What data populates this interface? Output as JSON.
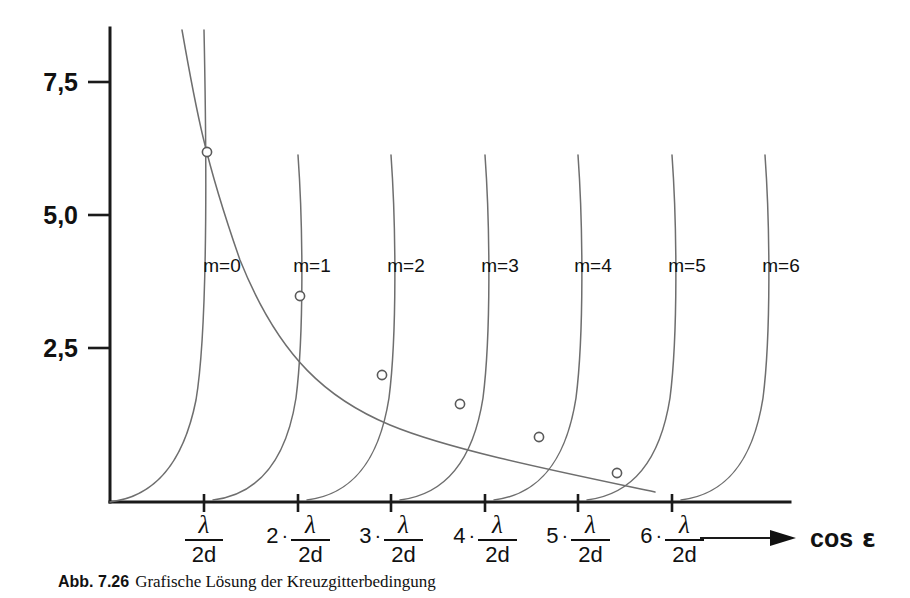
{
  "figure": {
    "caption_label": "Abb. 7.26",
    "caption_text": "Grafische Lösung der Kreuzgitterbedingung",
    "axis_color": "#1a1a1a",
    "curve_color": "#6e6e6e"
  },
  "yaxis": {
    "ticks": [
      {
        "label": "7,5",
        "value": 7.5,
        "y": 82
      },
      {
        "label": "5,0",
        "value": 5.0,
        "y": 215
      },
      {
        "label": "2,5",
        "value": 2.5,
        "y": 348
      }
    ]
  },
  "xaxis": {
    "name": "cos",
    "symbol": "ε",
    "numerator": "λ",
    "denominator": "2d",
    "ticks": [
      {
        "coefficient": "",
        "x": 204,
        "order": 1
      },
      {
        "coefficient": "2",
        "x": 298,
        "order": 2
      },
      {
        "coefficient": "3",
        "x": 391,
        "order": 3
      },
      {
        "coefficient": "4",
        "x": 485,
        "order": 4
      },
      {
        "coefficient": "5",
        "x": 578,
        "order": 5
      },
      {
        "coefficient": "6",
        "x": 672,
        "order": 6
      }
    ]
  },
  "chart_data": {
    "type": "line",
    "title": "Grafische Lösung der Kreuzgitterbedingung",
    "xlabel": "cos ε",
    "ylabel": "",
    "grid": false,
    "legend": "inline-curve-labels",
    "xlim": [
      0,
      7.3
    ],
    "ylim": [
      0,
      8.5
    ],
    "x_tick_labels": [
      "λ/2d",
      "2·λ/2d",
      "3·λ/2d",
      "4·λ/2d",
      "5·λ/2d",
      "6·λ/2d"
    ],
    "y_tick_labels": [
      "2,5",
      "5,0",
      "7,5"
    ],
    "series": [
      {
        "name": "m=0",
        "label_x": 222,
        "label_y": 272,
        "asymptote_tick": 1,
        "path": "M 110 502 C 150 497 182 470 196 400 C 206 340 208 220 204 30"
      },
      {
        "name": "m=1",
        "label_x": 312,
        "label_y": 272,
        "asymptote_tick": 2,
        "path": "M 213 500 C 253 495 285 468 296 398 C 304 335 303 225 298 155"
      },
      {
        "name": "m=2",
        "label_x": 406,
        "label_y": 272,
        "asymptote_tick": 3,
        "path": "M 307 500 C 347 495 378 468 389 398 C 397 335 396 225 391 155"
      },
      {
        "name": "m=3",
        "label_x": 500,
        "label_y": 272,
        "asymptote_tick": 4,
        "path": "M 400 500 C 440 495 472 468 483 398 C 491 335 490 225 485 155"
      },
      {
        "name": "m=4",
        "label_x": 593,
        "label_y": 272,
        "asymptote_tick": 5,
        "path": "M 494 500 C 534 495 565 468 576 398 C 584 335 583 225 578 155"
      },
      {
        "name": "m=5",
        "label_x": 687,
        "label_y": 272,
        "asymptote_tick": 6,
        "path": "M 587 500 C 627 495 659 468 670 398 C 678 335 677 225 672 155"
      },
      {
        "name": "m=6",
        "label_x": 781,
        "label_y": 272,
        "asymptote_tick": 7,
        "path": "M 681 500 C 721 495 752 468 763 398 C 771 335 770 225 765 155"
      }
    ],
    "envelope": {
      "name": "descending-hyperbola",
      "path": "M 182 30 C 196 110 205 160 240 260 C 280 360 330 400 390 425 C 450 450 560 472 655 492"
    },
    "intersections": [
      {
        "order": 0,
        "x": 207,
        "y": 152,
        "approx_value": 6.3
      },
      {
        "order": 1,
        "x": 300,
        "y": 296,
        "approx_value": 3.6
      },
      {
        "order": 2,
        "x": 382,
        "y": 375,
        "approx_value": 2.45
      },
      {
        "order": 3,
        "x": 460,
        "y": 404,
        "approx_value": 1.9
      },
      {
        "order": 4,
        "x": 539,
        "y": 437,
        "approx_value": 1.3
      },
      {
        "order": 5,
        "x": 617,
        "y": 473,
        "approx_value": 0.6
      }
    ]
  }
}
